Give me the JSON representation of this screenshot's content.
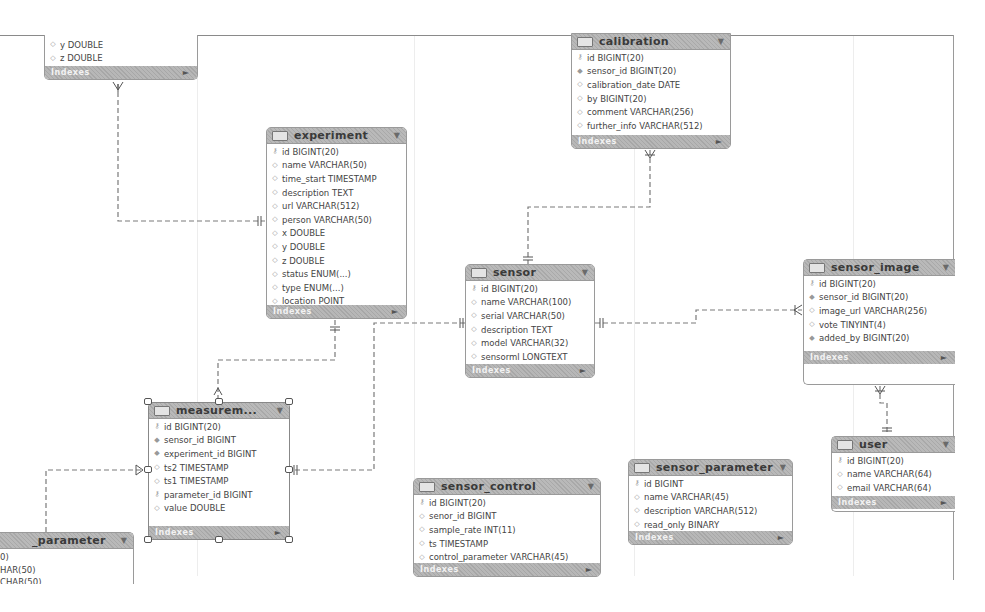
{
  "diagram": {
    "type": "EER diagram",
    "footer_label": "Indexes",
    "tables": {
      "partial_top_left": {
        "name": "",
        "columns": [
          {
            "icon": "diamond-icon",
            "text": "y DOUBLE"
          },
          {
            "icon": "diamond-icon",
            "text": "z DOUBLE"
          }
        ]
      },
      "calibration": {
        "name": "calibration",
        "columns": [
          {
            "icon": "key-icon",
            "text": "id BIGINT(20)"
          },
          {
            "icon": "diamond-filled-icon",
            "text": "sensor_id BIGINT(20)"
          },
          {
            "icon": "diamond-icon",
            "text": "calibration_date DATE"
          },
          {
            "icon": "diamond-icon",
            "text": "by BIGINT(20)"
          },
          {
            "icon": "diamond-icon",
            "text": "comment VARCHAR(256)"
          },
          {
            "icon": "diamond-icon",
            "text": "further_info VARCHAR(512)"
          }
        ]
      },
      "experiment": {
        "name": "experiment",
        "columns": [
          {
            "icon": "key-icon",
            "text": "id BIGINT(20)"
          },
          {
            "icon": "diamond-icon",
            "text": "name VARCHAR(50)"
          },
          {
            "icon": "diamond-icon",
            "text": "time_start TIMESTAMP"
          },
          {
            "icon": "diamond-icon",
            "text": "description TEXT"
          },
          {
            "icon": "diamond-icon",
            "text": "url VARCHAR(512)"
          },
          {
            "icon": "diamond-icon",
            "text": "person VARCHAR(50)"
          },
          {
            "icon": "diamond-icon",
            "text": "x DOUBLE"
          },
          {
            "icon": "diamond-icon",
            "text": "y DOUBLE"
          },
          {
            "icon": "diamond-icon",
            "text": "z DOUBLE"
          },
          {
            "icon": "diamond-icon",
            "text": "status ENUM(...)"
          },
          {
            "icon": "diamond-icon",
            "text": "type ENUM(...)"
          },
          {
            "icon": "diamond-icon",
            "text": "location POINT"
          }
        ]
      },
      "sensor": {
        "name": "sensor",
        "columns": [
          {
            "icon": "key-icon",
            "text": "id BIGINT(20)"
          },
          {
            "icon": "diamond-icon",
            "text": "name VARCHAR(100)"
          },
          {
            "icon": "diamond-icon",
            "text": "serial VARCHAR(50)"
          },
          {
            "icon": "diamond-icon",
            "text": "description TEXT"
          },
          {
            "icon": "diamond-icon",
            "text": "model VARCHAR(32)"
          },
          {
            "icon": "diamond-icon",
            "text": "sensorml LONGTEXT"
          }
        ]
      },
      "sensor_image": {
        "name": "sensor_image",
        "columns": [
          {
            "icon": "key-icon",
            "text": "id BIGINT(20)"
          },
          {
            "icon": "diamond-filled-icon",
            "text": "sensor_id BIGINT(20)"
          },
          {
            "icon": "diamond-icon",
            "text": "image_url VARCHAR(256)"
          },
          {
            "icon": "diamond-icon",
            "text": "vote TINYINT(4)"
          },
          {
            "icon": "diamond-filled-icon",
            "text": "added_by BIGINT(20)"
          }
        ]
      },
      "user": {
        "name": "user",
        "columns": [
          {
            "icon": "key-icon",
            "text": "id BIGINT(20)"
          },
          {
            "icon": "diamond-icon",
            "text": "name VARCHAR(64)"
          },
          {
            "icon": "diamond-icon",
            "text": "email VARCHAR(64)"
          }
        ]
      },
      "measurement": {
        "name": "measurem...",
        "columns": [
          {
            "icon": "key-icon",
            "text": "id BIGINT(20)"
          },
          {
            "icon": "diamond-filled-icon",
            "text": "sensor_id BIGINT"
          },
          {
            "icon": "diamond-filled-icon",
            "text": "experiment_id BIGINT"
          },
          {
            "icon": "diamond-icon",
            "text": "ts2 TIMESTAMP"
          },
          {
            "icon": "diamond-icon",
            "text": "ts1 TIMESTAMP"
          },
          {
            "icon": "key-icon",
            "text": "parameter_id BIGINT"
          },
          {
            "icon": "diamond-icon",
            "text": "value DOUBLE"
          }
        ]
      },
      "sensor_control": {
        "name": "sensor_control",
        "columns": [
          {
            "icon": "key-icon",
            "text": "id BIGINT(20)"
          },
          {
            "icon": "diamond-icon",
            "text": "senor_id BIGINT"
          },
          {
            "icon": "diamond-icon",
            "text": "sample_rate INT(11)"
          },
          {
            "icon": "diamond-icon",
            "text": "ts TIMESTAMP"
          },
          {
            "icon": "diamond-icon",
            "text": "control_parameter VARCHAR(45)"
          }
        ]
      },
      "sensor_parameter": {
        "name": "sensor_parameter",
        "columns": [
          {
            "icon": "key-icon",
            "text": "id BIGINT"
          },
          {
            "icon": "diamond-icon",
            "text": "name VARCHAR(45)"
          },
          {
            "icon": "diamond-icon",
            "text": "description VARCHAR(512)"
          },
          {
            "icon": "diamond-icon",
            "text": "read_only BINARY"
          }
        ]
      },
      "partial_bottom_left": {
        "name": "_parameter",
        "columns": [
          {
            "icon": "",
            "text": "0)"
          },
          {
            "icon": "",
            "text": "HAR(50)"
          },
          {
            "icon": "",
            "text": "CHAR(50)"
          }
        ]
      }
    }
  }
}
